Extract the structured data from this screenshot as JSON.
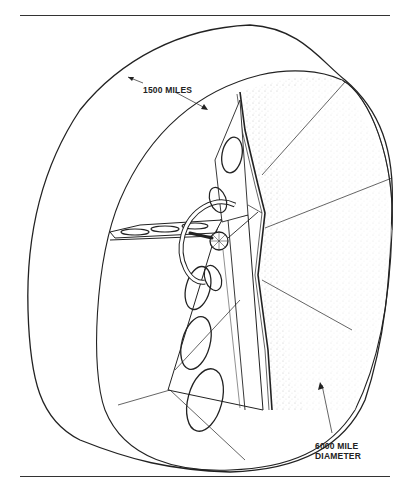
{
  "figure": {
    "labels": {
      "width": "1500 MILES",
      "diameter_line1": "6000 MILE",
      "diameter_line2": "DIAMETER"
    },
    "colors": {
      "line": "#222222",
      "background": "#ffffff",
      "stipple": "#999999"
    }
  }
}
